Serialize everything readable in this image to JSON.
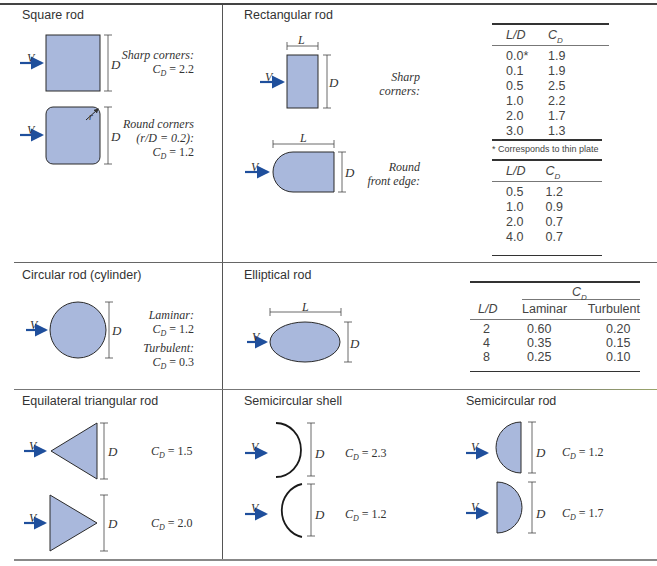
{
  "figure": {
    "colors": {
      "shape_fill": "#a9b8dc",
      "shape_stroke": "#2b2b2b",
      "arrow": "#1f4f9c",
      "text": "#333333",
      "rule": "#333333"
    },
    "panels": {
      "square_rod": {
        "title": "Square rod",
        "velocity_label": "V",
        "dimension_label": "D",
        "radius_label": "r",
        "cases": [
          {
            "condition": "Sharp corners:",
            "cd_value": "C_D = 2.2",
            "cd_number": "= 2.2"
          },
          {
            "condition_line1": "Round corners",
            "condition_line2": "(r/D = 0.2):",
            "cd_value": "C_D = 1.2",
            "cd_number": "= 1.2"
          }
        ]
      },
      "rectangular_rod": {
        "title": "Rectangular rod",
        "velocity_label": "V",
        "length_label": "L",
        "dimension_label": "D",
        "cases": [
          {
            "condition_line1": "Sharp",
            "condition_line2": "corners:"
          },
          {
            "condition_line1": "Round",
            "condition_line2": "front edge:"
          }
        ],
        "table_sharp": {
          "headers": [
            "L/D",
            "C_D"
          ],
          "rows": [
            [
              "0.0*",
              "1.9"
            ],
            [
              "0.1",
              "1.9"
            ],
            [
              "0.5",
              "2.5"
            ],
            [
              "1.0",
              "2.2"
            ],
            [
              "2.0",
              "1.7"
            ],
            [
              "3.0",
              "1.3"
            ]
          ],
          "footnote": "* Corresponds to thin plate"
        },
        "table_round": {
          "headers": [
            "L/D",
            "C_D"
          ],
          "rows": [
            [
              "0.5",
              "1.2"
            ],
            [
              "1.0",
              "0.9"
            ],
            [
              "2.0",
              "0.7"
            ],
            [
              "4.0",
              "0.7"
            ]
          ]
        }
      },
      "circular_rod": {
        "title": "Circular rod (cylinder)",
        "velocity_label": "V",
        "dimension_label": "D",
        "cases": [
          {
            "condition": "Laminar:",
            "cd_number": "= 1.2"
          },
          {
            "condition": "Turbulent:",
            "cd_number": "= 0.3"
          }
        ]
      },
      "elliptical_rod": {
        "title": "Elliptical rod",
        "velocity_label": "V",
        "length_label": "L",
        "dimension_label": "D",
        "table": {
          "group_header": "C_D",
          "headers": [
            "L/D",
            "Laminar",
            "Turbulent"
          ],
          "rows": [
            [
              "2",
              "0.60",
              "0.20"
            ],
            [
              "4",
              "0.35",
              "0.15"
            ],
            [
              "8",
              "0.25",
              "0.10"
            ]
          ]
        }
      },
      "triangular_rod": {
        "title": "Equilateral triangular rod",
        "velocity_label": "V",
        "dimension_label": "D",
        "cases": [
          {
            "cd_number": "= 1.5"
          },
          {
            "cd_number": "= 2.0"
          }
        ]
      },
      "semicircular_shell": {
        "title": "Semicircular shell",
        "velocity_label": "V",
        "dimension_label": "D",
        "cases": [
          {
            "cd_number": "= 2.3"
          },
          {
            "cd_number": "= 1.2"
          }
        ]
      },
      "semicircular_rod": {
        "title": "Semicircular rod",
        "velocity_label": "V",
        "dimension_label": "D",
        "cases": [
          {
            "cd_number": "= 1.2"
          },
          {
            "cd_number": "= 1.7"
          }
        ]
      }
    },
    "symbols": {
      "cd_main": "C",
      "cd_sub": "D"
    }
  }
}
